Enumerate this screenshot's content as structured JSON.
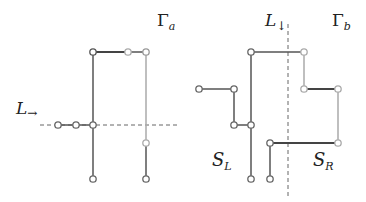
{
  "colors": {
    "dark_edge": "#555555",
    "light_edge": "#aaaaaa",
    "dashed": "#666666",
    "node_stroke_dark": "#666666",
    "node_stroke_light": "#aaaaaa",
    "node_fill": "#ffffff"
  },
  "graph_a": {
    "label": "Γ",
    "label_sub": "a",
    "line_label": "L",
    "line_label_sub": "→"
  },
  "graph_b": {
    "label": "Γ",
    "label_sub": "b",
    "line_label": "L",
    "line_label_sub": "↓",
    "left_set": "S",
    "left_set_sub": "L",
    "right_set": "S",
    "right_set_sub": "R"
  }
}
